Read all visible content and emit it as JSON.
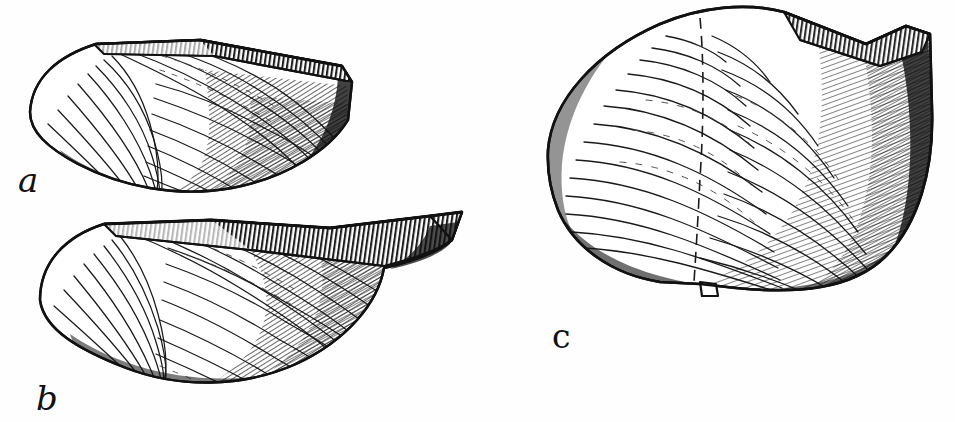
{
  "plate": {
    "kind": "scientific-illustration",
    "subject": "bivalve-shells",
    "technique": "pen-and-ink line engraving",
    "background_color": "#fefefe",
    "ink_color": "#111111",
    "width": 955,
    "height": 422
  },
  "figures": [
    {
      "label": "a",
      "label_style": "italic-lowercase",
      "label_x": 18,
      "label_y": 192,
      "description": "elongate bivalve valve, left lateral view, wedge-shaped with truncated dorsal hinge margin",
      "bbox": [
        28,
        38,
        332,
        154
      ],
      "orientation": "dorsal margin upper, posterior to right",
      "shading": "dense cross-hatching along posterior and ventral margins",
      "growth_lines": 26,
      "hinge_hatch_marks": 44
    },
    {
      "label": "b",
      "label_style": "italic-lowercase",
      "label_x": 36,
      "label_y": 410,
      "description": "elongate bivalve valve, left lateral view, produced posteriorly into a rostrum",
      "bbox": [
        35,
        210,
        435,
        175
      ],
      "orientation": "dorsal margin upper, posterior to right",
      "shading": "dense cross-hatching along posterior half and ventral margin",
      "growth_lines": 28,
      "hinge_hatch_marks": 52
    },
    {
      "label": "c",
      "label_style": "upright-lowercase",
      "label_x": 552,
      "label_y": 348,
      "description": "broad ovate bivalve valve, exterior view, umbo at upper centre with concentric growth lines",
      "bbox": [
        535,
        5,
        400,
        285
      ],
      "orientation": "umbo at top, ventral margin below",
      "shading": "heavy shading on posterior right flank and along ventral margin",
      "growth_lines": 30,
      "hinge_hatch_marks": 60
    }
  ],
  "colors": {
    "ink": "#111111",
    "ink_soft": "#3a3a3a",
    "paper": "#fefefe"
  }
}
